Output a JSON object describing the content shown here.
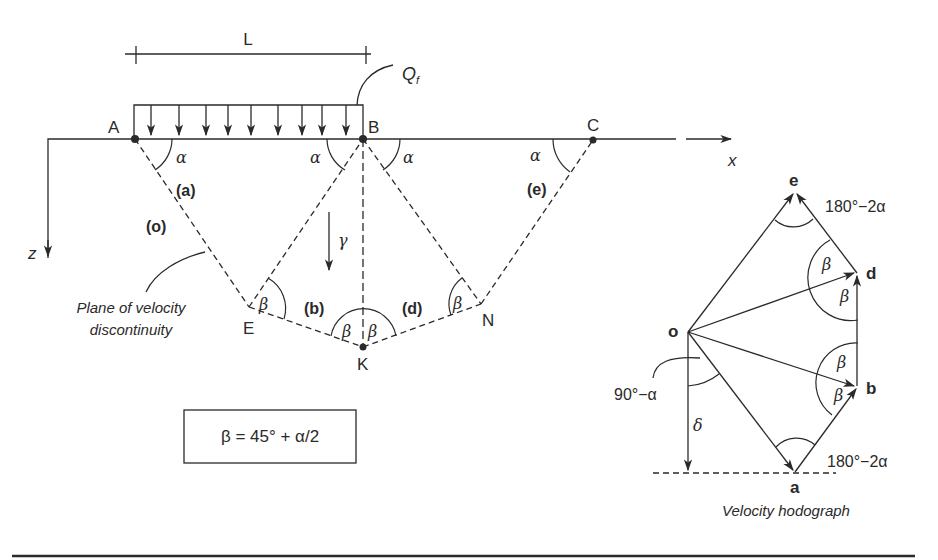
{
  "figure": {
    "dimension_label": "L",
    "load_label": "Q",
    "load_subscript": "f",
    "points": {
      "A": "A",
      "B": "B",
      "C": "C",
      "E": "E",
      "K": "K",
      "N": "N"
    },
    "axes": {
      "x": "x",
      "z": "z"
    },
    "regions": {
      "o": "(o)",
      "a": "(a)",
      "b": "(b)",
      "d": "(d)",
      "e": "(e)"
    },
    "angles": {
      "alpha": "α",
      "beta": "β",
      "gamma": "γ",
      "delta": "δ"
    },
    "annotation": {
      "line1": "Plane of velocity",
      "line2": "discontinuity"
    },
    "formula": "β = 45° + α/2"
  },
  "hodograph": {
    "title": "Velocity hodograph",
    "points": {
      "o": "o",
      "a": "a",
      "b": "b",
      "d": "d",
      "e": "e"
    },
    "angle_top": "180°−2α",
    "angle_bottom": "180°−2α",
    "angle_left": "90°−α",
    "delta": "δ",
    "beta": "β"
  }
}
